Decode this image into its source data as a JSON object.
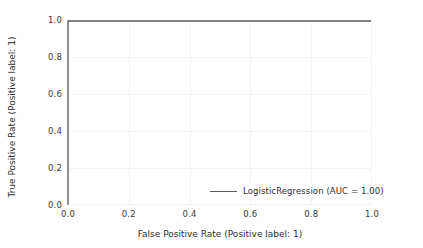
{
  "chart_data": {
    "type": "line",
    "title": "",
    "xlabel": "False Positive Rate (Positive label: 1)",
    "ylabel": "True Positive Rate (Positive label: 1)",
    "xlim": [
      0.0,
      1.0
    ],
    "ylim": [
      0.0,
      1.0
    ],
    "grid": true,
    "legend_position": "lower right",
    "xticks": [
      "0.0",
      "0.2",
      "0.4",
      "0.6",
      "0.8",
      "1.0"
    ],
    "xtick_values": [
      0.0,
      0.2,
      0.4,
      0.6,
      0.8,
      1.0
    ],
    "yticks": [
      "0.0",
      "0.2",
      "0.4",
      "0.6",
      "0.8",
      "1.0"
    ],
    "ytick_values": [
      0.0,
      0.2,
      0.4,
      0.6,
      0.8,
      1.0
    ],
    "series": [
      {
        "name": "LogisticRegression (AUC = 1.00)",
        "model": "LogisticRegression",
        "auc": "1.00",
        "color": "#5b5b5b",
        "x": [
          0.0,
          0.0,
          1.0
        ],
        "y": [
          0.0,
          1.0,
          1.0
        ]
      }
    ],
    "legend_entries": [
      "LogisticRegression (AUC = 1.00)"
    ],
    "colors": {
      "curve": "#5b5b5b",
      "grid": "#f4f4f4",
      "text": "#2e2e2e",
      "background": "#ffffff"
    }
  }
}
